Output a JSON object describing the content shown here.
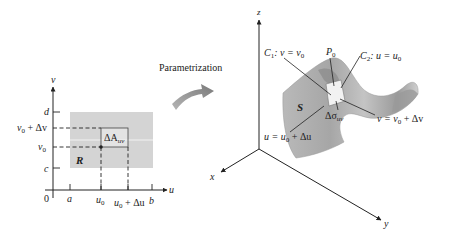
{
  "diagram": {
    "arrow_label": "Parametrization",
    "uv_plane": {
      "axes": {
        "horizontal": "u",
        "vertical": "v",
        "origin": "0"
      },
      "region_label": "R",
      "patch_label": {
        "base": "ΔA",
        "sub": "uv"
      },
      "u_ticks": [
        {
          "base": "a",
          "sub": "",
          "suffix": ""
        },
        {
          "base": "u",
          "sub": "0",
          "suffix": ""
        },
        {
          "base": "u",
          "sub": "0",
          "suffix": " + Δu"
        },
        {
          "base": "b",
          "sub": "",
          "suffix": ""
        }
      ],
      "v_ticks": [
        {
          "base": "d",
          "sub": "",
          "suffix": ""
        },
        {
          "base": "v",
          "sub": "0",
          "suffix": " + Δv"
        },
        {
          "base": "v",
          "sub": "0",
          "suffix": ""
        },
        {
          "base": "c",
          "sub": "",
          "suffix": ""
        }
      ]
    },
    "surface": {
      "axes": {
        "x": "x",
        "y": "y",
        "z": "z"
      },
      "surface_label": "S",
      "point_label": {
        "base": "P",
        "sub": "0"
      },
      "patch_label": {
        "base": "Δσ",
        "sub": "uv"
      },
      "curve_c1": {
        "name": "C",
        "sub": "1",
        "eq_lhs": ": v = v",
        "eq_sub": "0"
      },
      "curve_c2": {
        "name": "C",
        "sub": "2",
        "eq_lhs": ": u = u",
        "eq_sub": "0"
      },
      "edge_v": {
        "lhs": "v = v",
        "sub": "0",
        "suffix": " + Δv"
      },
      "edge_u": {
        "lhs": "u = u",
        "sub": "0",
        "suffix": " + Δu"
      }
    },
    "colors": {
      "region_fill": "#d4d4d4",
      "patch_fill": "#e6e6e6",
      "axis": "#222222",
      "surface_light": "#c9c9c9",
      "surface_mid": "#a9a9a9",
      "surface_dark": "#8c8c8c",
      "arrow_fill": "#8f8f8f"
    }
  }
}
